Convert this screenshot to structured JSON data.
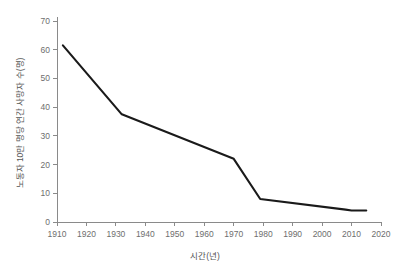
{
  "chart_data": {
    "type": "line",
    "title": "",
    "xlabel": "시간(년)",
    "ylabel": "노동자 10만 명당 연간 사망자 수(명)",
    "xlim": [
      1910,
      2020
    ],
    "ylim": [
      0,
      70
    ],
    "grid": false,
    "legend": false,
    "legend_position": "none",
    "xticks": [
      1910,
      1920,
      1930,
      1940,
      1950,
      1960,
      1970,
      1980,
      1990,
      2000,
      2010,
      2020
    ],
    "xtick_labels": [
      "1910",
      "1920",
      "1930",
      "1940",
      "1950",
      "1960",
      "1970",
      "1980",
      "1990",
      "2000",
      "2010",
      "2020"
    ],
    "yticks": [
      0,
      10,
      20,
      30,
      40,
      50,
      60,
      70
    ],
    "ytick_labels": [
      "0",
      "10",
      "20",
      "30",
      "40",
      "50",
      "60",
      "70"
    ],
    "series": [
      {
        "name": "노동자 10만 명당 연간 사망자 수",
        "color": "#1a1a1a",
        "x": [
          1912,
          1932,
          1970,
          1979,
          2008,
          2010,
          2015
        ],
        "values": [
          61.5,
          37.5,
          22.0,
          8.0,
          4.3,
          4.0,
          4.0
        ]
      }
    ]
  },
  "style": {
    "line_color": "#1a1a1a",
    "axis_color": "#8a8a8a",
    "text_color": "#6e6e6e",
    "title_color": "#555555",
    "background": "#ffffff"
  }
}
